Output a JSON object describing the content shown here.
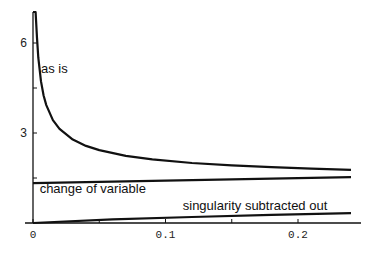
{
  "chart_data": {
    "type": "line",
    "title": "",
    "xlabel": "",
    "ylabel": "",
    "xlim": [
      0,
      0.2415
    ],
    "ylim": [
      0,
      7
    ],
    "grid": false,
    "legend": "none (inline annotations)",
    "x_ticks": [
      {
        "value": 0,
        "label": "0"
      },
      {
        "value": 0.05,
        "label": ""
      },
      {
        "value": 0.1,
        "label": "0.1"
      },
      {
        "value": 0.15,
        "label": ""
      },
      {
        "value": 0.2,
        "label": "0.2"
      }
    ],
    "y_ticks": [
      {
        "value": 1.5,
        "label": ""
      },
      {
        "value": 3,
        "label": "3"
      },
      {
        "value": 4.5,
        "label": ""
      },
      {
        "value": 6,
        "label": "6"
      }
    ],
    "series": [
      {
        "name": "as is",
        "x": [
          0.0015,
          0.002,
          0.003,
          0.004,
          0.006,
          0.008,
          0.01,
          0.015,
          0.02,
          0.03,
          0.04,
          0.05,
          0.07,
          0.09,
          0.12,
          0.15,
          0.18,
          0.21,
          0.24
        ],
        "values": [
          8.2,
          7.29,
          6.17,
          5.51,
          4.72,
          4.25,
          3.93,
          3.43,
          3.14,
          2.78,
          2.57,
          2.43,
          2.24,
          2.12,
          2.0,
          1.92,
          1.86,
          1.81,
          1.77
        ]
      },
      {
        "name": "change of variable",
        "x": [
          0,
          0.06,
          0.12,
          0.18,
          0.24
        ],
        "values": [
          1.33,
          1.38,
          1.43,
          1.48,
          1.53
        ]
      },
      {
        "name": "singularity subtracted out",
        "x": [
          0,
          0.06,
          0.12,
          0.18,
          0.24
        ],
        "values": [
          0.0,
          0.12,
          0.2,
          0.27,
          0.33
        ]
      }
    ],
    "annotations": [
      {
        "text": "as is",
        "x": 0.003,
        "y": 5.0
      },
      {
        "text": "change of variable",
        "x": 0.002,
        "y": 1.0
      },
      {
        "text": "singularity subtracted out",
        "x": 0.11,
        "y": 0.45
      }
    ]
  }
}
